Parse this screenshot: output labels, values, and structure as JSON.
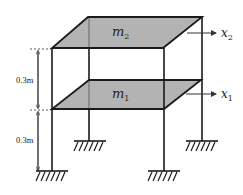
{
  "diagram": {
    "colors": {
      "slab_fill": "#b3b3b3",
      "line": "#1a1a1a",
      "background": "#ffffff"
    },
    "masses": [
      {
        "id": "m2",
        "base": "m",
        "sub": "2",
        "level": "top"
      },
      {
        "id": "m1",
        "base": "m",
        "sub": "1",
        "level": "middle"
      }
    ],
    "displacements": [
      {
        "id": "x2",
        "base": "x",
        "sub": "2"
      },
      {
        "id": "x1",
        "base": "x",
        "sub": "1"
      }
    ],
    "dimensions": [
      {
        "label": "0.3m",
        "span": "floor 1 to floor 2"
      },
      {
        "label": "0.3m",
        "span": "ground to floor 1"
      }
    ],
    "supports": [
      "fixed",
      "fixed",
      "fixed",
      "fixed"
    ]
  }
}
